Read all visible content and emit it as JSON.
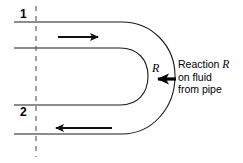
{
  "figure": {
    "stroke_color": "#1a1a1a",
    "dash_color": "#555555"
  },
  "sections": {
    "inlet_label": "1",
    "outlet_label": "2"
  },
  "force": {
    "symbol": "R",
    "annotation_line1_prefix": "Reaction ",
    "annotation_line1_symbol": "R",
    "annotation_line2": "on fluid",
    "annotation_line3": "from pipe"
  },
  "flow": {
    "inlet_direction": "right",
    "outlet_direction": "left"
  }
}
